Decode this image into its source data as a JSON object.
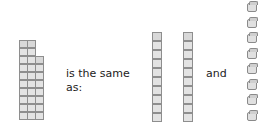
{
  "statement": {
    "text_1": "is the same",
    "text_2": "as:",
    "text_and": "and"
  },
  "diagram": {
    "left_block": {
      "columns": [
        10,
        10,
        8
      ],
      "description": "28 unit cubes: two towers of 10 and a tower of 8 joined"
    },
    "tens_rods": 2,
    "single_cubes": 8
  },
  "colors": {
    "cube_fill": "#e3e3e3",
    "cube_edge": "#8e8e8e",
    "text": "#222222"
  }
}
